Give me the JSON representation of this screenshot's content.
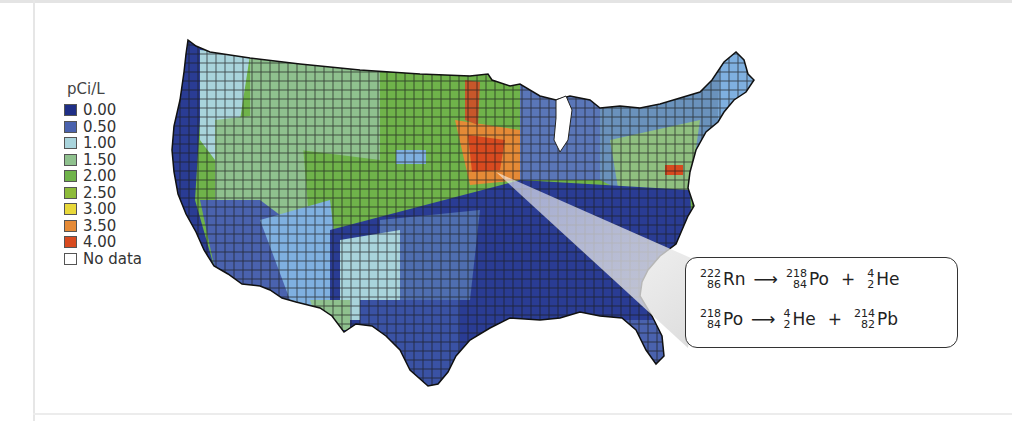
{
  "legend": {
    "title": "pCi/L",
    "items": [
      {
        "label": "0.00",
        "color": "#1f2f86"
      },
      {
        "label": "0.50",
        "color": "#4a62ae"
      },
      {
        "label": "1.00",
        "color": "#a9d4dc"
      },
      {
        "label": "1.50",
        "color": "#8fc18e"
      },
      {
        "label": "2.00",
        "color": "#6fb34a"
      },
      {
        "label": "2.50",
        "color": "#8dbb3a"
      },
      {
        "label": "3.00",
        "color": "#e8d83a"
      },
      {
        "label": "3.50",
        "color": "#e58a36"
      },
      {
        "label": "4.00",
        "color": "#d84a1f"
      },
      {
        "label": "No data",
        "color": "#ffffff"
      }
    ]
  },
  "map": {
    "subject": "Radon concentration by US county",
    "callout_origin": "Upper Midwest (Iowa region)"
  },
  "equations": [
    {
      "reactant": {
        "mass": "222",
        "atomic": "86",
        "symbol": "Rn"
      },
      "arrow": "⟶",
      "products": [
        {
          "mass": "218",
          "atomic": "84",
          "symbol": "Po"
        },
        {
          "mass": "4",
          "atomic": "2",
          "symbol": "He"
        }
      ],
      "plus": "+"
    },
    {
      "reactant": {
        "mass": "218",
        "atomic": "84",
        "symbol": "Po"
      },
      "arrow": "⟶",
      "products": [
        {
          "mass": "4",
          "atomic": "2",
          "symbol": "He"
        },
        {
          "mass": "214",
          "atomic": "82",
          "symbol": "Pb"
        }
      ],
      "plus": "+"
    }
  ]
}
